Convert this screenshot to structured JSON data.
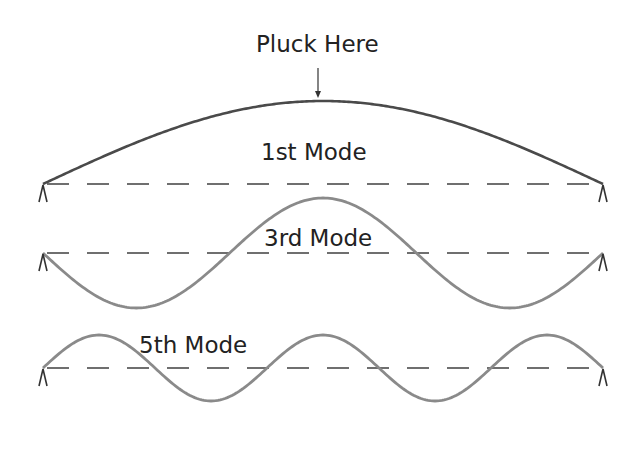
{
  "annotation": {
    "label": "Pluck Here",
    "arrow": {
      "x": 318,
      "y1": 68,
      "y2": 98
    }
  },
  "string": {
    "x_start": 43,
    "x_end": 603
  },
  "colors": {
    "mode1_curve": "#4a4a4a",
    "mode_curves": "#8a8a8a",
    "baseline_dash": "#6f6f6f",
    "supports": "#333333",
    "text": "#222222"
  },
  "modes": [
    {
      "name": "1st Mode",
      "harmonic": 1,
      "baseline_y": 184,
      "amplitude": 83,
      "phase_sign": -1,
      "color_key": "mode1_curve"
    },
    {
      "name": "3rd Mode",
      "harmonic": 3,
      "baseline_y": 253,
      "amplitude": 55,
      "phase_sign": 1,
      "color_key": "mode_curves"
    },
    {
      "name": "5th Mode",
      "harmonic": 5,
      "baseline_y": 368,
      "amplitude": 33,
      "phase_sign": -1,
      "color_key": "mode_curves"
    }
  ]
}
